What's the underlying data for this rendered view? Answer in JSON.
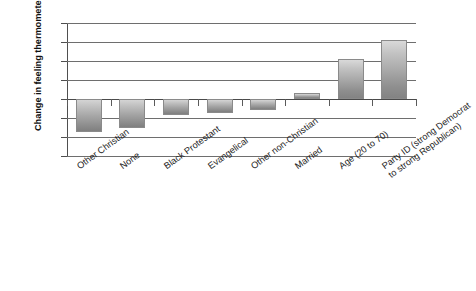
{
  "chart_data": {
    "type": "bar",
    "title": "",
    "xlabel": "",
    "ylabel": "Change in feeling thermometer",
    "ylim": [
      -15,
      20
    ],
    "yticks": [
      20,
      15,
      10,
      5,
      0,
      -5,
      -10,
      -15
    ],
    "ytick_labels": [
      "20",
      "15",
      "10",
      "5",
      "0",
      "−5",
      "−10",
      "−15"
    ],
    "grid": true,
    "legend": "none",
    "orientation": "vertical",
    "bar_style": "vertical gray gradient, light top to dark bottom",
    "categories": [
      "Other Christian",
      "None",
      "Black Protestant",
      "Evangelical",
      "Other non-Christian",
      "Married",
      "Age (20 to 70)",
      "Party ID (strong Democrat\nto strong Republican)"
    ],
    "category_labels_display": [
      "Other Christian",
      "None",
      "Black Protestant",
      "Evangelical",
      "Other non-Christian",
      "Married",
      "Age (20 to 70)",
      "Party ID (strong Democrat to strong Republican)"
    ],
    "values": [
      -8.8,
      -7.5,
      -4.3,
      -3.6,
      -3.0,
      1.7,
      10.5,
      15.4
    ],
    "colors": {
      "bar_top": "#d9d9d9",
      "bar_bottom": "#838383",
      "gridline": "#6e6e6e",
      "axis": "#4f4f4f",
      "text": "#111111",
      "background": "#ffffff"
    }
  }
}
